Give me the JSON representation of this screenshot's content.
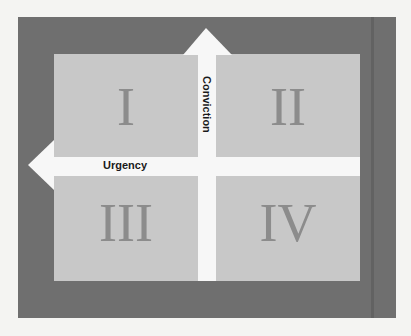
{
  "diagram": {
    "axes": {
      "vertical": {
        "label": "Conviction",
        "direction": "up"
      },
      "horizontal": {
        "label": "Urgency",
        "direction": "left"
      }
    },
    "quadrants": [
      {
        "id": "top-left",
        "numeral": "I"
      },
      {
        "id": "top-right",
        "numeral": "II"
      },
      {
        "id": "bottom-left",
        "numeral": "III"
      },
      {
        "id": "bottom-right",
        "numeral": "IV"
      }
    ],
    "colors": {
      "frame": "#6f6f6f",
      "quadrant_fill": "#c8c8c8",
      "arrow": "#f7f7f7",
      "numeral": "#8c8c8c",
      "label": "#1a1a1a"
    }
  }
}
